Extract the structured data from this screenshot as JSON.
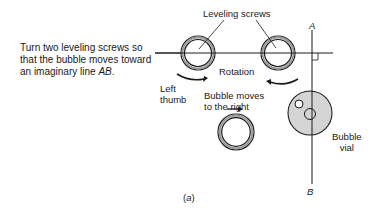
{
  "instruction": {
    "line1": "Turn two leveling screws so",
    "line2": "that the bubble moves toward",
    "line3_prefix": "an imaginary line ",
    "line3_italic": "AB",
    "line3_suffix": "."
  },
  "labels": {
    "leveling_screws": "Leveling screws",
    "rotation": "Rotation",
    "left_thumb_1": "Left",
    "left_thumb_2": "thumb",
    "bubble_moves_1": "Bubble moves",
    "bubble_moves_2": "to the right",
    "bubble_vial_1": "Bubble",
    "bubble_vial_2": "vial",
    "point_a": "A",
    "point_b": "B",
    "caption": "(a)"
  },
  "colors": {
    "ink": "#1a1a1a",
    "vial_fill": "#d4d4d4",
    "background": "#ffffff"
  }
}
